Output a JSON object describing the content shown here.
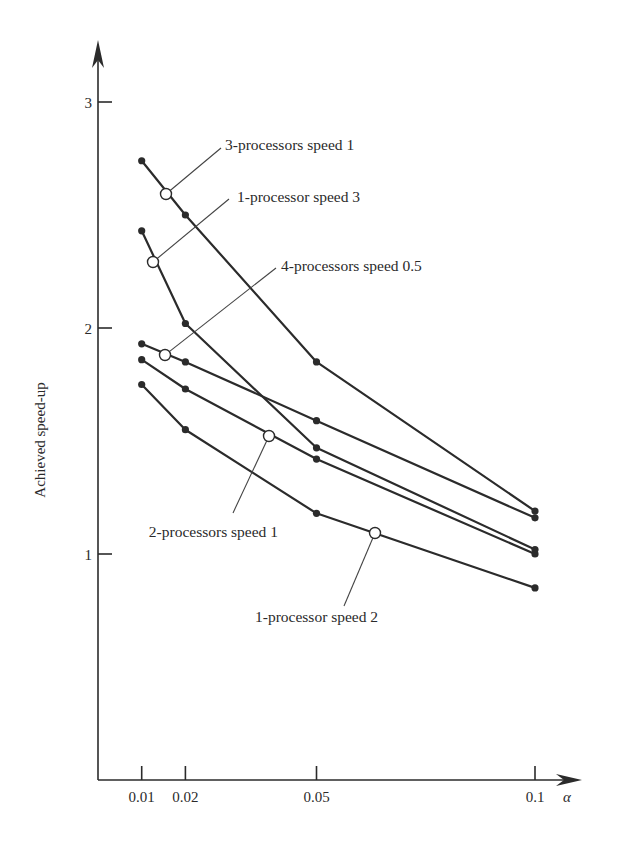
{
  "chart_data": {
    "type": "line",
    "title": "",
    "xlabel": "α",
    "ylabel": "Achieved speed-up",
    "x": [
      0.01,
      0.02,
      0.05,
      0.1
    ],
    "x_tick_labels": [
      "0.01",
      "0.02",
      "0.05",
      "0.1"
    ],
    "y_ticks": [
      1,
      2,
      3
    ],
    "y_tick_labels": [
      "1",
      "2",
      "3"
    ],
    "ylim": [
      0,
      3.3
    ],
    "xlim": [
      0,
      0.11
    ],
    "grid": false,
    "legend": "inline annotations with leader lines",
    "series": [
      {
        "name": "3-processors speed 1",
        "values": [
          2.74,
          2.5,
          1.85,
          1.19
        ]
      },
      {
        "name": "1-processor speed 3",
        "values": [
          2.43,
          2.02,
          1.47,
          1.02
        ]
      },
      {
        "name": "4-processors speed 0.5",
        "values": [
          1.93,
          1.85,
          1.59,
          1.16
        ]
      },
      {
        "name": "2-processors speed 1",
        "values": [
          1.86,
          1.73,
          1.42,
          1.0
        ]
      },
      {
        "name": "1-processor speed 2",
        "values": [
          1.75,
          1.55,
          1.18,
          0.85
        ]
      }
    ],
    "annotations": [
      {
        "text": "3-processors speed 1",
        "circle": [
          166,
          194
        ],
        "leader_end": [
          221,
          148
        ],
        "label_pos": [
          225,
          150
        ],
        "anchor": "start"
      },
      {
        "text": "1-processor speed 3",
        "circle": [
          153,
          262
        ],
        "leader_end": [
          229,
          199
        ],
        "label_pos": [
          237,
          202
        ],
        "anchor": "start"
      },
      {
        "text": "4-processors speed 0.5",
        "circle": [
          165,
          355
        ],
        "leader_end": [
          276,
          268
        ],
        "label_pos": [
          281,
          271
        ],
        "anchor": "start"
      },
      {
        "text": "2-processors speed 1",
        "circle": [
          269,
          436
        ],
        "leader_end": [
          233,
          513
        ],
        "label_pos": [
          278,
          537
        ],
        "anchor": "end"
      },
      {
        "text": "1-processor speed 2",
        "circle": [
          375,
          533
        ],
        "leader_end": [
          344,
          606
        ],
        "label_pos": [
          255,
          622
        ],
        "anchor": "start"
      }
    ]
  },
  "layout": {
    "origin_px": [
      98,
      780
    ],
    "x_px_per_unit": 4370,
    "y_px_per_unit": 226,
    "x_axis_end_px": 582,
    "y_axis_top_px": 40
  }
}
